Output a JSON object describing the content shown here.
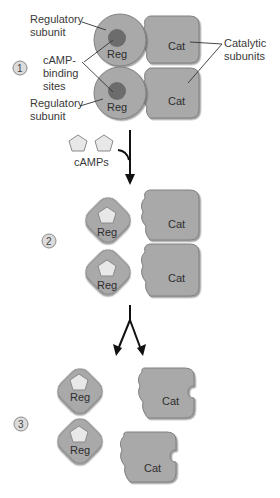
{
  "labels": {
    "regulatory_top": [
      "Regulatory",
      "subunit"
    ],
    "camp_binding": [
      "cAMP-",
      "binding",
      "sites"
    ],
    "regulatory_bottom": [
      "Regulatory",
      "subunit"
    ],
    "catalytic": [
      "Catalytic",
      "subunits"
    ],
    "camps": "cAMPs"
  },
  "subunit_text": {
    "reg": "Reg",
    "cat": "Cat"
  },
  "steps": [
    "1",
    "2",
    "3"
  ],
  "colors": {
    "subunit_fill": "#a8a8a8",
    "subunit_stroke": "#7a7a7a",
    "binding_site": "#6e6e6e",
    "camp_fill": "#e6e6e6",
    "step_fill": "#d8d8d8",
    "arrow": "#111111",
    "leader": "#333333"
  }
}
